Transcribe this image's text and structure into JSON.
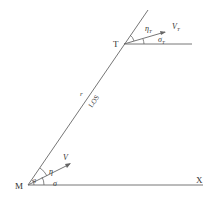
{
  "diagram": {
    "type": "missile-target engagement geometry",
    "points": {
      "missile": "M",
      "target": "T",
      "reference_axis": "X"
    },
    "line_labels": {
      "range": "r",
      "line_of_sight": "LOS"
    },
    "vectors": {
      "missile_velocity": "V",
      "target_velocity": "V",
      "target_velocity_sub": "T"
    },
    "angles": {
      "missile_heading_to_los": "η",
      "missile_flight_path": "σ",
      "los_angle": "q",
      "target_heading_to_los": "η",
      "target_heading_to_los_sub": "T",
      "target_flight_path": "σ",
      "target_flight_path_sub": "T"
    },
    "colors": {
      "line": "#555555",
      "text": "#333333",
      "background": "#ffffff"
    }
  }
}
